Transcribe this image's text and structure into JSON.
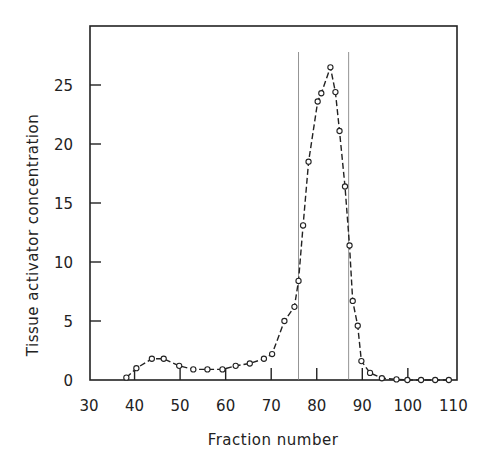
{
  "chart_data": {
    "type": "line",
    "title": "",
    "xlabel": "Fraction number",
    "ylabel": "Tissue activator concentration",
    "xlim": [
      30,
      110
    ],
    "ylim": [
      0,
      30
    ],
    "xticks": [
      30,
      40,
      50,
      60,
      70,
      80,
      90,
      100,
      110
    ],
    "yticks": [
      0,
      5,
      10,
      15,
      20,
      25
    ],
    "grid": false,
    "legend": null,
    "marker": "open-circle",
    "line_style": "dashed",
    "series": [
      {
        "name": "Tissue activator",
        "x": [
          38.2,
          40.4,
          43.8,
          46.4,
          49.8,
          52.9,
          56.0,
          59.3,
          62.2,
          65.3,
          68.4,
          70.2,
          72.9,
          75.1,
          76.0,
          77.0,
          78.2,
          80.2,
          81.0,
          83.0,
          84.1,
          85.0,
          86.2,
          87.2,
          87.9,
          89.0,
          89.8,
          91.7,
          94.3,
          97.5,
          99.9,
          102.9,
          106.0,
          109.0
        ],
        "y": [
          0.2,
          1.0,
          1.8,
          1.8,
          1.2,
          0.9,
          0.9,
          0.9,
          1.2,
          1.4,
          1.8,
          2.2,
          5.0,
          6.2,
          8.4,
          13.1,
          18.5,
          23.6,
          24.3,
          26.5,
          24.4,
          21.1,
          16.4,
          11.4,
          6.7,
          4.6,
          1.6,
          0.6,
          0.15,
          0.05,
          0.0,
          0.0,
          0.0,
          0.0
        ]
      }
    ],
    "annotations": [
      {
        "type": "vertical-line",
        "x": 76.0,
        "label": "pool start"
      },
      {
        "type": "vertical-line",
        "x": 87.0,
        "label": "pool end"
      }
    ]
  }
}
